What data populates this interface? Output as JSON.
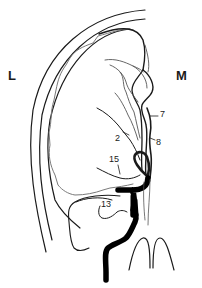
{
  "figure": {
    "side_labels": {
      "lateral": "L",
      "medial": "M"
    },
    "callouts": [
      {
        "id": "7",
        "text": "7"
      },
      {
        "id": "8",
        "text": "8"
      },
      {
        "id": "2",
        "text": "2"
      },
      {
        "id": "15",
        "text": "15"
      },
      {
        "id": "13",
        "text": "13"
      }
    ],
    "colors": {
      "line": "#1a1a1a",
      "gray_line": "#808080",
      "background": "#ffffff"
    }
  }
}
